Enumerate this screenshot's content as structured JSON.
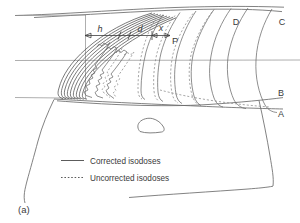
{
  "figure": {
    "caption": "(a)",
    "type": "isodose-distribution-diagram"
  },
  "point_labels": {
    "p": "P"
  },
  "dimension_labels": {
    "h": "h",
    "d": "d",
    "x": "x"
  },
  "curve_labels": [
    {
      "id": "A",
      "label": "A"
    },
    {
      "id": "B",
      "label": "B"
    },
    {
      "id": "C",
      "label": "C"
    },
    {
      "id": "D",
      "label": "D"
    }
  ],
  "legend": {
    "items": [
      {
        "style": "solid",
        "label": "Corrected isodoses"
      },
      {
        "style": "dotted",
        "label": "Uncorrected isodoses"
      }
    ]
  },
  "colors": {
    "background": "#ffffff",
    "ink": "#5a5a5a",
    "ink_dark": "#3d3d3d",
    "grid": "#8d8d8d",
    "dashed": "#8a8a8a",
    "text": "#3a3a3a"
  }
}
